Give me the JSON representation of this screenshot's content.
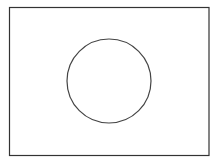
{
  "diagram": {
    "background": "#ffffff",
    "frame": {
      "x": 9.5,
      "y": 7.5,
      "width": 199.5,
      "height": 148,
      "stroke": "#333333",
      "stroke_width": 1.2
    },
    "circle": {
      "cx": 109,
      "cy": 81,
      "r": 42,
      "stroke": "#444444",
      "stroke_width": 1.2,
      "fill": "none"
    }
  }
}
